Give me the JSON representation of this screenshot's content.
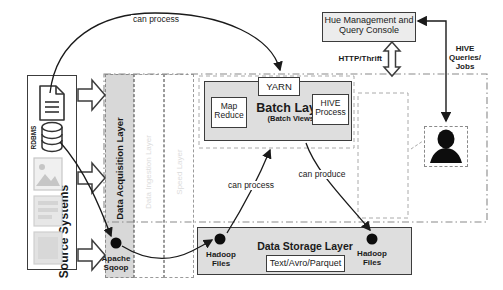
{
  "source_panel": {
    "title": "Source Systems",
    "rdbms_label": "RDBMS"
  },
  "layers": {
    "acquisition_label": "Data Acquisition Layer",
    "faded_label_1": "Data Ingestion Layer",
    "faded_label_2": "Speed Layer"
  },
  "acquisition": {
    "tool": "Apache Sqoop"
  },
  "batch": {
    "yarn": "YARN",
    "title": "Batch Layer",
    "subtitle": "(Batch Views)",
    "map_reduce": "Map Reduce",
    "hive_process": "HIVE Process"
  },
  "storage": {
    "title": "Data Storage Layer",
    "formats": "Text/Avro/Parquet",
    "hadoop_left": "Hadoop Files",
    "hadoop_right": "Hadoop Files"
  },
  "hue": {
    "title": "Hue Management and Query Console",
    "protocol_label": "HTTP/Thrift",
    "user_label": "HIVE Queries/ Jobs"
  },
  "edges": {
    "top_process": "can process",
    "bottom_process": "can process",
    "bottom_produce": "can produce"
  },
  "colors": {
    "box_fill": "#dedede",
    "line": "#1a1a1a",
    "border": "#3c3c3c",
    "faded_text": "#dcdcdc"
  }
}
